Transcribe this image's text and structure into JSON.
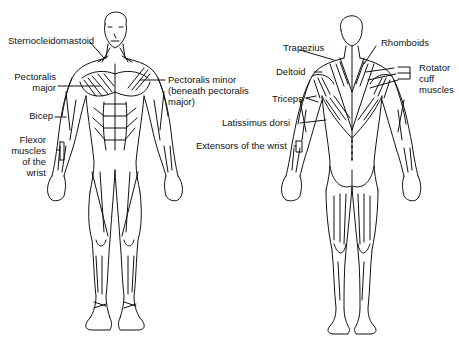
{
  "front_view": {
    "labels": [
      {
        "id": "sternocleidomastoid",
        "text": "Sternocleidomastoid"
      },
      {
        "id": "pectoralis-major-1",
        "text": "Pectoralis"
      },
      {
        "id": "pectoralis-major-2",
        "text": "major"
      },
      {
        "id": "pectoralis-minor-1",
        "text": "Pectoralis minor"
      },
      {
        "id": "pectoralis-minor-2",
        "text": "(beneath pectoralis"
      },
      {
        "id": "pectoralis-minor-3",
        "text": "major)"
      },
      {
        "id": "bicep",
        "text": "Bicep"
      },
      {
        "id": "flexor-1",
        "text": "Flexor"
      },
      {
        "id": "flexor-2",
        "text": "muscles"
      },
      {
        "id": "flexor-3",
        "text": "of the"
      },
      {
        "id": "flexor-4",
        "text": "wrist"
      }
    ]
  },
  "back_view": {
    "labels": [
      {
        "id": "trapezius",
        "text": "Trapezius"
      },
      {
        "id": "rhomboids",
        "text": "Rhomboids"
      },
      {
        "id": "deltoid",
        "text": "Deltoid"
      },
      {
        "id": "rotator-1",
        "text": "Rotator"
      },
      {
        "id": "rotator-2",
        "text": "cuff"
      },
      {
        "id": "rotator-3",
        "text": "muscles"
      },
      {
        "id": "triceps",
        "text": "Triceps"
      },
      {
        "id": "latissimus",
        "text": "Latissimus dorsi"
      },
      {
        "id": "extensors",
        "text": "Extensors of the wrist"
      }
    ]
  },
  "colors": {
    "line": "#111111",
    "background": "#ffffff"
  }
}
